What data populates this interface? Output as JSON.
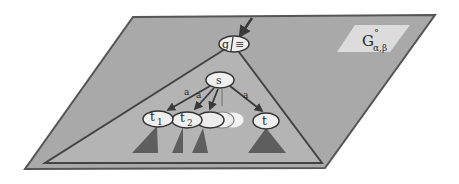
{
  "diagram": {
    "plane_label": {
      "main": "G",
      "superscript": "°",
      "subscript": "α,β"
    },
    "root_node": {
      "left": "g",
      "right": "≡"
    },
    "nodes": [
      {
        "id": "s",
        "label": "s"
      },
      {
        "id": "t1",
        "label": "t",
        "subscript": "1"
      },
      {
        "id": "t2",
        "label": "t",
        "subscript": "2"
      },
      {
        "id": "t",
        "label": "t"
      }
    ],
    "edge_labels": {
      "s_t1": "a",
      "s_t2": "a",
      "s_t": "a"
    },
    "colors": {
      "plane_fill": "#a9a9a9",
      "plane_stroke": "#555555",
      "label_box": "#dcdcdc",
      "node_fill": "#efefef",
      "subtree_fill": "#5e5e5e"
    }
  }
}
